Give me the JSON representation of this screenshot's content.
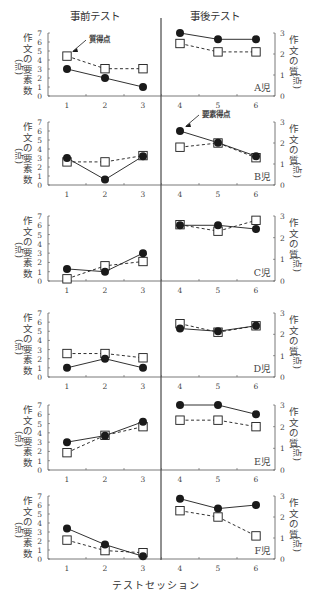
{
  "figure": {
    "header_pre": "事前テスト",
    "header_post": "事後テスト",
    "x_axis_title": "テストセッション",
    "left_axis_label": "作文の要素数",
    "left_axis_unit": "(点)",
    "right_axis_label": "作文の質",
    "right_axis_unit": "(点)",
    "annotation_quality": "質得点",
    "annotation_elements": "要素得点",
    "colors": {
      "line": "#1a1a1a",
      "axis": "#555555",
      "text": "#444444",
      "marker_fill_open": "#ffffff"
    }
  },
  "chart_data": {
    "type": "line",
    "title": "",
    "xlabel": "テストセッション",
    "ylabel": "作文の要素数(点)",
    "ylabel_right": "作文の質(点)",
    "x": [
      1,
      2,
      3,
      4,
      5,
      6
    ],
    "phases": [
      {
        "name": "事前テスト",
        "sessions": [
          1,
          2,
          3
        ]
      },
      {
        "name": "事後テスト",
        "sessions": [
          4,
          5,
          6
        ]
      }
    ],
    "ylim": [
      0,
      7
    ],
    "ylim_right": [
      0,
      3
    ],
    "yticks": [
      0,
      1,
      2,
      3,
      4,
      5,
      6,
      7
    ],
    "yticks_right": [
      0,
      1,
      2,
      3
    ],
    "legend": [
      {
        "name": "要素得点",
        "marker": "filled-circle",
        "line": "solid",
        "axis": "left"
      },
      {
        "name": "質得点",
        "marker": "open-square",
        "line": "dashed",
        "axis": "right"
      }
    ],
    "panels": [
      {
        "label": "A児",
        "elements": [
          3,
          2,
          1,
          7,
          6.3,
          6.3
        ],
        "quality": [
          1.9,
          1.3,
          1.3,
          2.5,
          2.1,
          2.1
        ],
        "annotation": {
          "text": "質得点",
          "target": "quality",
          "session": 1
        }
      },
      {
        "label": "B児",
        "elements": [
          3,
          0.6,
          3.2,
          6,
          4.7,
          3.2
        ],
        "quality": [
          1.1,
          1.1,
          1.4,
          1.8,
          2.0,
          1.3
        ],
        "annotation": {
          "text": "要素得点",
          "target": "elements",
          "session": 4
        }
      },
      {
        "label": "C児",
        "elements": [
          1.3,
          1.0,
          3.0,
          6,
          6,
          5.6
        ],
        "quality": [
          0.1,
          0.7,
          0.9,
          2.6,
          2.3,
          2.8
        ]
      },
      {
        "label": "D児",
        "elements": [
          1,
          2,
          1,
          5.3,
          5.0,
          5.6
        ],
        "quality": [
          1.1,
          1.1,
          0.9,
          2.5,
          2.1,
          2.4
        ]
      },
      {
        "label": "E児",
        "elements": [
          3,
          3.7,
          5.2,
          7,
          7,
          6
        ],
        "quality": [
          0.8,
          1.6,
          2.0,
          2.3,
          2.3,
          2.0
        ]
      },
      {
        "label": "F児",
        "elements": [
          3.4,
          1.6,
          0.3,
          6.7,
          5.6,
          6
        ],
        "quality": [
          0.9,
          0.4,
          0.3,
          2.3,
          2.0,
          1.1
        ]
      }
    ]
  }
}
